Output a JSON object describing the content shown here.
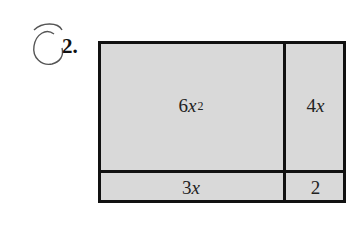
{
  "problem": {
    "number": "2."
  },
  "diagram": {
    "cells": {
      "top_left": {
        "coef": "6",
        "var": "x",
        "exp": "2"
      },
      "top_right": {
        "coef": "4",
        "var": "x"
      },
      "bottom_left": {
        "coef": "3",
        "var": "x"
      },
      "bottom_right": {
        "coef": "2"
      }
    },
    "fill_color": "#d9d9d9",
    "border_color": "#111111"
  }
}
